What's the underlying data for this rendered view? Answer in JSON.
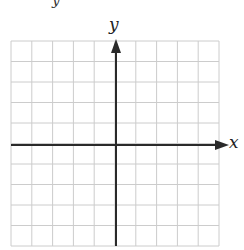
{
  "figure": {
    "type": "coordinate-grid",
    "top_text_fragment": "y",
    "x_axis_label": "x",
    "y_axis_label": "y",
    "grid": {
      "columns": 10,
      "rows": 10,
      "left": 11,
      "top": 41,
      "right": 219,
      "bottom": 246,
      "line_color": "#cccccc"
    },
    "axes": {
      "color": "#2a2a2a",
      "x_axis_y": 145,
      "y_axis_x": 116
    }
  }
}
